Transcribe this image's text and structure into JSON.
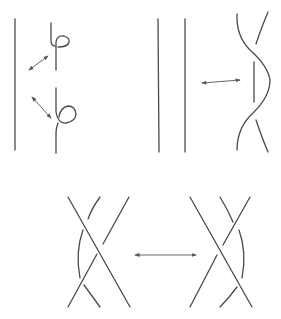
{
  "figure": {
    "background": "#ffffff",
    "stroke_color": "#4a4a4a",
    "panels": [
      {
        "id": "move-1",
        "name": "Reidemeister move I",
        "left": "straight strand",
        "right": "strand with kink loops (two variants)",
        "arrow": "double-headed diagonal (x2)"
      },
      {
        "id": "move-2",
        "name": "Reidemeister move II",
        "left": "two parallel strands",
        "right": "two strands overlapping with two crossings",
        "arrow": "double-headed horizontal"
      },
      {
        "id": "move-3",
        "name": "Reidemeister move III",
        "left": "three strands, third strand passes left of crossing",
        "right": "three strands, third strand passes right of crossing",
        "arrow": "double-headed horizontal"
      }
    ]
  }
}
